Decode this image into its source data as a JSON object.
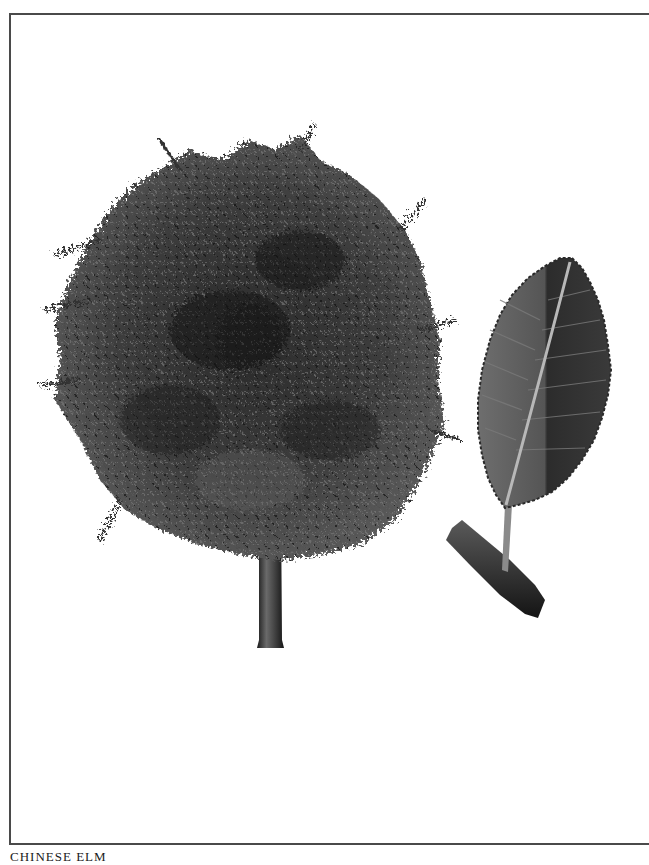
{
  "plate": {
    "caption": "CHINESE ELM",
    "subjects": [
      {
        "name": "tree",
        "description": "Rounded dense canopy of small leaves on a single straight trunk"
      },
      {
        "name": "leaf",
        "description": "Single serrated elliptical leaf with prominent midrib on a short twig"
      }
    ],
    "colors": {
      "border": "#4a4a4a",
      "foliage_dark": "#1e1e1e",
      "foliage_mid": "#4a4a4a",
      "foliage_light": "#7a7a7a",
      "background": "#ffffff"
    }
  }
}
